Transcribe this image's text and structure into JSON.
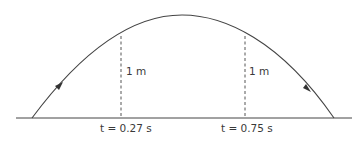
{
  "diagram": {
    "type": "projectile-trajectory",
    "colors": {
      "line": "#444444",
      "dashed": "#555555",
      "text": "#3a3a3a"
    },
    "markers": [
      {
        "time_label": "t = 0.27 s",
        "height_label": "1 m"
      },
      {
        "time_label": "t = 0.75 s",
        "height_label": "1 m"
      }
    ],
    "arrows": [
      "ascending-direction",
      "descending-direction"
    ]
  }
}
